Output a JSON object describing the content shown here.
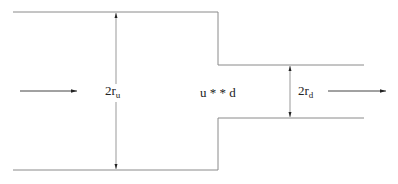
{
  "diagram": {
    "type": "pipe-contraction",
    "labels": {
      "upstream_diameter": {
        "base": "2r",
        "sub": "u"
      },
      "downstream_diameter": {
        "base": "2r",
        "sub": "d"
      },
      "junction": "u * * d"
    },
    "colors": {
      "pipe_wall": "#8a8a8a",
      "arrow": "#222222",
      "text": "#222222"
    }
  }
}
